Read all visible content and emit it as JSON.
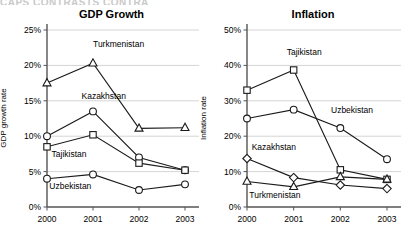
{
  "page": {
    "cut_off_header": "CAPS CONTRASTS  CONTRA"
  },
  "chart_data": [
    {
      "type": "line",
      "id": "gdp-growth",
      "title": "GDP Growth",
      "xlabel": "",
      "ylabel": "GDP growth rate",
      "categories": [
        "2000",
        "2001",
        "2002",
        "2003"
      ],
      "ylim": [
        0,
        25
      ],
      "ytick_labels": [
        "0%",
        "5%",
        "10%",
        "15%",
        "20%",
        "25%"
      ],
      "ytick_values": [
        0,
        5,
        10,
        15,
        20,
        25
      ],
      "grid": true,
      "legend_position": "inline-annotations",
      "series": [
        {
          "name": "Turkmenistan",
          "marker": "triangle",
          "values": [
            17.5,
            20.3,
            11.1,
            11.2
          ],
          "label_x": 2001,
          "label_y": 22.6
        },
        {
          "name": "Kazakhstan",
          "marker": "circle",
          "values": [
            10.0,
            13.5,
            7.0,
            5.2
          ],
          "label_x": 2000.75,
          "label_y": 15.2
        },
        {
          "name": "Tajikistan",
          "marker": "square",
          "values": [
            8.5,
            10.2,
            6.2,
            5.2
          ],
          "label_x": 2000.1,
          "label_y": 7.0
        },
        {
          "name": "Uzbekistan",
          "marker": "circle",
          "values": [
            4.0,
            4.6,
            2.4,
            3.2
          ],
          "label_x": 2000.05,
          "label_y": 2.5
        }
      ]
    },
    {
      "type": "line",
      "id": "inflation",
      "title": "Inflation",
      "xlabel": "",
      "ylabel": "Inflation rate",
      "categories": [
        "2000",
        "2001",
        "2002",
        "2003"
      ],
      "ylim": [
        0,
        50
      ],
      "ytick_labels": [
        "0%",
        "10%",
        "20%",
        "30%",
        "40%",
        "50%"
      ],
      "ytick_values": [
        0,
        10,
        20,
        30,
        40,
        50
      ],
      "grid": true,
      "legend_position": "inline-annotations",
      "series": [
        {
          "name": "Tajikistan",
          "marker": "square",
          "values": [
            33.0,
            38.7,
            10.5,
            7.8
          ],
          "label_x": 2000.85,
          "label_y": 43.0
        },
        {
          "name": "Uzbekistan",
          "marker": "circle",
          "values": [
            25.0,
            27.5,
            22.3,
            13.5
          ],
          "label_x": 2001.8,
          "label_y": 26.5
        },
        {
          "name": "Kazakhstan",
          "marker": "diamond",
          "values": [
            13.7,
            8.3,
            6.2,
            5.2
          ],
          "label_x": 2000.1,
          "label_y": 16.0
        },
        {
          "name": "Turkmenistan",
          "marker": "triangle",
          "values": [
            7.2,
            5.7,
            8.5,
            7.8
          ],
          "label_x": 2000.05,
          "label_y": 2.6
        }
      ]
    }
  ]
}
